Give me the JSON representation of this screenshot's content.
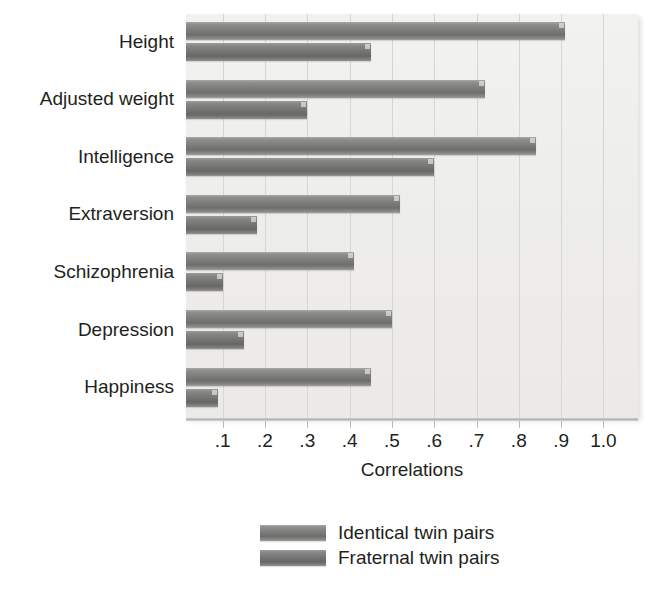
{
  "chart_data": {
    "type": "bar",
    "orientation": "horizontal",
    "title": "",
    "xlabel": "Correlations",
    "ylabel": "",
    "xlim": [
      0,
      1.06
    ],
    "xticks": [
      0.1,
      0.2,
      0.3,
      0.4,
      0.5,
      0.6,
      0.7,
      0.8,
      0.9,
      1.0
    ],
    "xtick_labels": [
      ".1",
      ".2",
      ".3",
      ".4",
      ".5",
      ".6",
      ".7",
      ".8",
      ".9",
      "1.0"
    ],
    "grid": "vertical",
    "legend_position": "bottom-center",
    "categories": [
      "Height",
      "Adjusted weight",
      "Intelligence",
      "Extraversion",
      "Schizophrenia",
      "Depression",
      "Happiness"
    ],
    "series": [
      {
        "name": "Identical twin pairs",
        "color": "#7c7c7a",
        "values": [
          0.91,
          0.72,
          0.84,
          0.52,
          0.41,
          0.5,
          0.45
        ]
      },
      {
        "name": "Fraternal twin pairs",
        "color": "#747472",
        "values": [
          0.45,
          0.3,
          0.6,
          0.18,
          0.1,
          0.15,
          0.09
        ]
      }
    ]
  },
  "legend": {
    "items": [
      {
        "label": "Identical twin pairs",
        "swatch": "identical"
      },
      {
        "label": "Fraternal twin pairs",
        "swatch": "fraternal"
      }
    ]
  },
  "colors": {
    "plot_background": "#efefed",
    "gridline": "#d6d6d2",
    "axis": "#b4b4b0",
    "text": "#231f20",
    "bar_identical": "#7c7c7a",
    "bar_fraternal": "#747472"
  }
}
